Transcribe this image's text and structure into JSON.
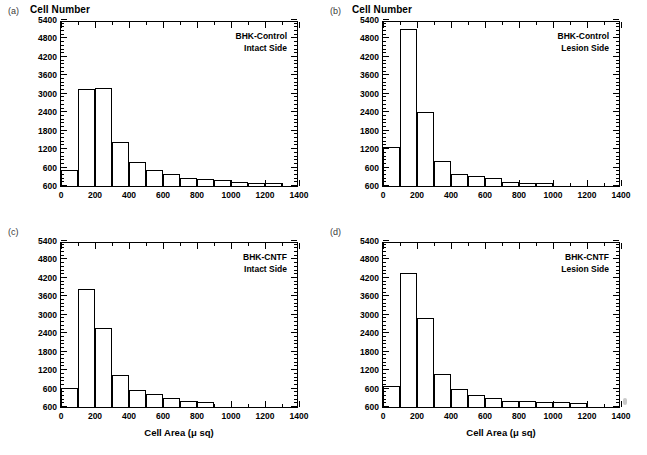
{
  "figure": {
    "axis_title": "Cell Area (μ sq)",
    "column_title": "Cell Number",
    "ink_color": "#000000"
  },
  "axes": {
    "y_ticks": [
      "600",
      "600",
      "1200",
      "1800",
      "2400",
      "3000",
      "3600",
      "4200",
      "4800",
      "5400"
    ],
    "x_ticks": [
      "0",
      "200",
      "400",
      "600",
      "800",
      "1000",
      "1200",
      "1400"
    ],
    "x_min": 0,
    "x_max": 1400,
    "y_min": 0,
    "y_max": 5400,
    "x_major_step": 200,
    "x_minor_step": 100,
    "y_major_step": 600,
    "y_minor_step": 120,
    "grid": false
  },
  "panels": [
    {
      "letter": "(a)",
      "title": "Cell Number",
      "show_title": true,
      "annotation_line1": "BHK-Control",
      "annotation_line2": "Intact Side"
    },
    {
      "letter": "(b)",
      "title": "Cell Number",
      "show_title": true,
      "annotation_line1": "BHK-Control",
      "annotation_line2": "Lesion  Side"
    },
    {
      "letter": "(c)",
      "title": "",
      "show_title": false,
      "annotation_line1": "BHK-CNTF",
      "annotation_line2": "Intact Side"
    },
    {
      "letter": "(d)",
      "title": "",
      "show_title": false,
      "annotation_line1": "BHK-CNTF",
      "annotation_line2": "Lesion Side"
    }
  ],
  "chart_data": [
    {
      "type": "bar",
      "panel": "(a)",
      "title": "Cell Number",
      "annotation": "BHK-Control Intact Side",
      "xlabel": "Cell Area (μ sq)",
      "ylabel": "Cell Number",
      "xlim": [
        0,
        1400
      ],
      "ylim": [
        0,
        5400
      ],
      "bin_width": 100,
      "bin_starts": [
        0,
        100,
        200,
        300,
        400,
        500,
        600,
        700,
        800,
        900,
        1000,
        1100,
        1200
      ],
      "categories": [
        "0-100",
        "100-200",
        "200-300",
        "300-400",
        "400-500",
        "500-600",
        "600-700",
        "700-800",
        "800-900",
        "900-1000",
        "1000-1100",
        "1100-1200",
        "1200-1300"
      ],
      "values": [
        520,
        3140,
        3200,
        1430,
        780,
        520,
        400,
        250,
        220,
        180,
        130,
        100,
        90
      ]
    },
    {
      "type": "bar",
      "panel": "(b)",
      "title": "Cell Number",
      "annotation": "BHK-Control Lesion Side",
      "xlabel": "Cell Area (μ sq)",
      "ylabel": "Cell Number",
      "xlim": [
        0,
        1400
      ],
      "ylim": [
        0,
        5400
      ],
      "bin_width": 100,
      "bin_starts": [
        0,
        100,
        200,
        300,
        400,
        500,
        600,
        700,
        800,
        900
      ],
      "categories": [
        "0-100",
        "100-200",
        "200-300",
        "300-400",
        "400-500",
        "500-600",
        "600-700",
        "700-800",
        "800-900",
        "900-1000"
      ],
      "values": [
        1270,
        5100,
        2400,
        820,
        400,
        330,
        270,
        120,
        100,
        110
      ]
    },
    {
      "type": "bar",
      "panel": "(c)",
      "title": "",
      "annotation": "BHK-CNTF Intact Side",
      "xlabel": "Cell Area (μ sq)",
      "ylabel": "Cell Number",
      "xlim": [
        0,
        1400
      ],
      "ylim": [
        0,
        5400
      ],
      "bin_width": 100,
      "bin_starts": [
        0,
        100,
        200,
        300,
        400,
        500,
        600,
        700,
        800
      ],
      "categories": [
        "0-100",
        "100-200",
        "200-300",
        "300-400",
        "400-500",
        "500-600",
        "600-700",
        "700-800",
        "800-900"
      ],
      "values": [
        620,
        3850,
        2580,
        1050,
        560,
        410,
        280,
        200,
        160
      ]
    },
    {
      "type": "bar",
      "panel": "(d)",
      "title": "",
      "annotation": "BHK-CNTF Lesion Side",
      "xlabel": "Cell Area (μ sq)",
      "ylabel": "Cell Number",
      "xlim": [
        0,
        1400
      ],
      "ylim": [
        0,
        5400
      ],
      "bin_width": 100,
      "bin_starts": [
        0,
        100,
        200,
        300,
        400,
        500,
        600,
        700,
        800,
        900,
        1000,
        1100
      ],
      "categories": [
        "0-100",
        "100-200",
        "200-300",
        "300-400",
        "400-500",
        "500-600",
        "600-700",
        "700-800",
        "800-900",
        "900-1000",
        "1000-1100",
        "1100-1200"
      ],
      "values": [
        680,
        4370,
        2890,
        1090,
        590,
        390,
        300,
        200,
        180,
        160,
        150,
        140
      ]
    }
  ]
}
